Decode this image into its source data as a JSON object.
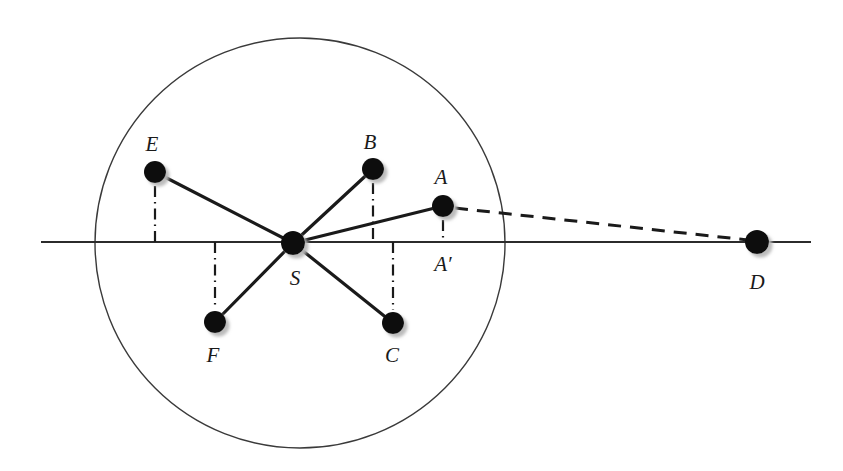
{
  "figure": {
    "background_color": "#ffffff",
    "stroke_color": "#1a1a1a",
    "node_fill_color": "#111111",
    "shadow_color": "#bdbdbd",
    "thin_line_color": "#444444"
  },
  "circle": {
    "name": "main-circle",
    "cx": 300,
    "cy": 243,
    "r": 205,
    "stroke_width": 1.4
  },
  "axis": {
    "name": "horizontal-axis",
    "x1": 41,
    "y1": 242,
    "x2": 811,
    "y2": 242,
    "stroke_width": 1.8
  },
  "nodes": [
    {
      "id": "E",
      "label": "E",
      "cx": 155,
      "cy": 172,
      "r": 11,
      "label_x": 152,
      "label_y": 151,
      "label_anchor": "middle"
    },
    {
      "id": "B",
      "label": "B",
      "cx": 373,
      "cy": 169,
      "r": 11,
      "label_x": 370,
      "label_y": 149,
      "label_anchor": "middle"
    },
    {
      "id": "A",
      "label": "A",
      "cx": 443,
      "cy": 206,
      "r": 11,
      "label_x": 441,
      "label_y": 184,
      "label_anchor": "middle"
    },
    {
      "id": "S",
      "label": "S",
      "cx": 293,
      "cy": 243,
      "r": 12,
      "label_x": 295,
      "label_y": 285,
      "label_anchor": "middle"
    },
    {
      "id": "F",
      "label": "F",
      "cx": 215,
      "cy": 322,
      "r": 11,
      "label_x": 213,
      "label_y": 362,
      "label_anchor": "middle"
    },
    {
      "id": "C",
      "label": "C",
      "cx": 393,
      "cy": 323,
      "r": 11,
      "label_x": 392,
      "label_y": 362,
      "label_anchor": "middle"
    },
    {
      "id": "D",
      "label": "D",
      "cx": 757,
      "cy": 242,
      "r": 12,
      "label_x": 757,
      "label_y": 289,
      "label_anchor": "middle"
    }
  ],
  "foot_labels": [
    {
      "id": "Aprime",
      "label": "A′",
      "x": 443,
      "y": 271,
      "anchor": "middle"
    }
  ],
  "spokes": [
    {
      "name": "spoke-S-E",
      "from": "S",
      "to": "E",
      "x1": 293,
      "y1": 243,
      "x2": 155,
      "y2": 172
    },
    {
      "name": "spoke-S-B",
      "from": "S",
      "to": "B",
      "x1": 293,
      "y1": 243,
      "x2": 373,
      "y2": 169
    },
    {
      "name": "spoke-S-A",
      "from": "S",
      "to": "A",
      "x1": 293,
      "y1": 243,
      "x2": 443,
      "y2": 206
    },
    {
      "name": "spoke-S-F",
      "from": "S",
      "to": "F",
      "x1": 293,
      "y1": 243,
      "x2": 215,
      "y2": 322
    },
    {
      "name": "spoke-S-C",
      "from": "S",
      "to": "C",
      "x1": 293,
      "y1": 243,
      "x2": 393,
      "y2": 323
    }
  ],
  "dashed_ray": {
    "name": "dashed-ray-A-D",
    "from": "A",
    "to": "D",
    "x1": 455,
    "y1": 208,
    "x2": 748,
    "y2": 240,
    "dash_pattern": "13 9",
    "stroke_width": 3
  },
  "projections": [
    {
      "name": "projection-E",
      "node": "E",
      "x": 155,
      "y_top": 186,
      "y_bottom": 242
    },
    {
      "name": "projection-B",
      "node": "B",
      "x": 373,
      "y_top": 183,
      "y_bottom": 242
    },
    {
      "name": "projection-A",
      "node": "A",
      "x": 443,
      "y_top": 220,
      "y_bottom": 242
    },
    {
      "name": "projection-F",
      "node": "F",
      "x": 215,
      "y_top": 242,
      "y_bottom": 309
    },
    {
      "name": "projection-C",
      "node": "C",
      "x": 393,
      "y_top": 242,
      "y_bottom": 310
    }
  ],
  "projection_style": {
    "dash_pattern": "11 5 1.5 5",
    "stroke_width": 2.2
  }
}
